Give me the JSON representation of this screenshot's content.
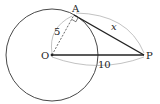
{
  "diagram": {
    "points": {
      "O": {
        "label": "O",
        "x": 52,
        "y": 55
      },
      "A": {
        "label": "A",
        "x": 74,
        "y": 15
      },
      "P": {
        "label": "P",
        "x": 144,
        "y": 55
      }
    },
    "circle": {
      "center": "O",
      "radius_px": 46
    },
    "segments": [
      {
        "from": "O",
        "to": "A",
        "style": "dashed",
        "label": "5"
      },
      {
        "from": "A",
        "to": "P",
        "style": "solid-bold",
        "label": "x"
      },
      {
        "from": "O",
        "to": "P",
        "style": "solid-bold",
        "label": "10"
      }
    ],
    "right_angle_at": "A",
    "labels": {
      "O": "O",
      "A": "A",
      "P": "P",
      "OA": "5",
      "AP": "x",
      "OP": "10"
    }
  }
}
